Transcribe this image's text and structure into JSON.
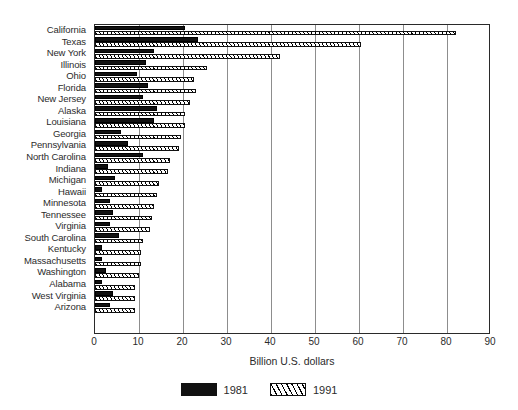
{
  "chart_data": {
    "type": "bar",
    "orientation": "horizontal",
    "title": "",
    "xlabel": "Billion U.S. dollars",
    "ylabel": "",
    "xlim": [
      0,
      90
    ],
    "xticks": [
      0,
      10,
      20,
      30,
      40,
      50,
      60,
      70,
      80,
      90
    ],
    "grid": true,
    "legend_position": "bottom",
    "categories": [
      "California",
      "Texas",
      "New York",
      "Illinois",
      "Ohio",
      "Florida",
      "New Jersey",
      "Alaska",
      "Louisiana",
      "Georgia",
      "Pennsylvania",
      "North Carolina",
      "Indiana",
      "Michigan",
      "Hawaii",
      "Minnesota",
      "Tennessee",
      "Virginia",
      "South Carolina",
      "Kentucky",
      "Massachusetts",
      "Washington",
      "Alabama",
      "West Virginia",
      "Arizona"
    ],
    "series": [
      {
        "name": "1981",
        "color": "#111111",
        "pattern": "solid",
        "values": [
          20.5,
          23.5,
          13.5,
          11.5,
          9.5,
          12.0,
          11.0,
          14.0,
          13.5,
          6.0,
          7.5,
          11.0,
          3.0,
          4.5,
          1.5,
          3.5,
          4.0,
          3.5,
          5.5,
          1.5,
          1.5,
          2.5,
          1.5,
          4.0,
          3.5
        ]
      },
      {
        "name": "1991",
        "color": "#ffffff",
        "pattern": "hatched",
        "values": [
          82.0,
          60.5,
          42.0,
          25.5,
          22.5,
          23.0,
          21.5,
          20.5,
          20.5,
          19.5,
          19.0,
          17.0,
          16.5,
          14.5,
          14.0,
          13.5,
          13.0,
          12.5,
          11.0,
          10.5,
          10.5,
          10.0,
          9.0,
          9.0,
          9.0
        ]
      }
    ]
  },
  "legend": {
    "items": [
      {
        "label": "1981",
        "swatch": "solid-black-swatch"
      },
      {
        "label": "1991",
        "swatch": "hatched-swatch"
      }
    ]
  }
}
